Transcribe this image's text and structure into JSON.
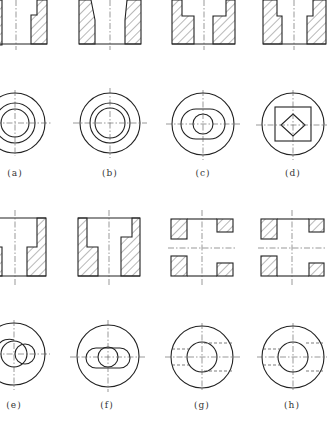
{
  "figure": {
    "type": "engineering-drawing-exercise",
    "panels": [
      {
        "id": "a",
        "label": "(a)",
        "front_view": "stepped bore section, cropped at left edge",
        "top_view": "three concentric circles with center lines"
      },
      {
        "id": "b",
        "label": "(b)",
        "front_view": "flared/curved bore section",
        "top_view": "three concentric circles with center lines"
      },
      {
        "id": "c",
        "label": "(c)",
        "front_view": "counterbored stepped section",
        "top_view": "outer circle, obround slot, inner circle"
      },
      {
        "id": "d",
        "label": "(d)",
        "front_view": "counterbored stepped section",
        "top_view": "outer circle, square, inscribed rotated square"
      },
      {
        "id": "e",
        "label": "(e)",
        "front_view": "stepped bore with right-side step, cropped at left edge",
        "top_view": "outer circle, two overlapping circles"
      },
      {
        "id": "f",
        "label": "(f)",
        "front_view": "stepped bore section",
        "top_view": "outer circle, obround slot with inner circle"
      },
      {
        "id": "g",
        "label": "(g)",
        "front_view": "section with four hatched blocks and horizontal center line",
        "top_view": "outer circle, inner circle, hidden lines"
      },
      {
        "id": "h",
        "label": "(h)",
        "front_view": "section with four hatched blocks and horizontal center line",
        "top_view": "outer circle, inner circle, hidden lines"
      }
    ]
  },
  "labels": {
    "a": "(a)",
    "b": "(b)",
    "c": "(c)",
    "d": "(d)",
    "e": "(e)",
    "f": "(f)",
    "g": "(g)",
    "h": "(h)"
  }
}
